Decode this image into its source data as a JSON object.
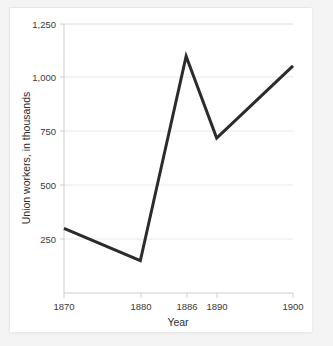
{
  "chart_data": {
    "type": "line",
    "title": "",
    "xlabel": "Year",
    "ylabel": "Union workers, in thousands",
    "x": [
      1870,
      1880,
      1886,
      1890,
      1900
    ],
    "values": [
      300,
      150,
      1100,
      720,
      1055
    ],
    "series": [
      {
        "name": "Union workers",
        "values": [
          300,
          150,
          1100,
          720,
          1055
        ]
      }
    ],
    "xtick_labels": [
      "1870",
      "1880",
      "1886",
      "1890",
      "1900"
    ],
    "xtick_values": [
      1870,
      1880,
      1886,
      1890,
      1900
    ],
    "ytick_labels": [
      "250",
      "500",
      "750",
      "1,000",
      "1,250"
    ],
    "ytick_values": [
      250,
      500,
      750,
      1000,
      1250
    ],
    "xlim": [
      1870,
      1900
    ],
    "ylim": [
      0,
      1250
    ],
    "grid": "horizontal",
    "legend": "none",
    "line_color": "#2b2b2b",
    "grid_color": "#e3e3e3",
    "axis_color": "#cccccc",
    "background_color": "#ffffff"
  },
  "labels": {
    "x_axis_title": "Year",
    "y_axis_title": "Union workers, in thousands",
    "y_1250": "1,250",
    "y_1000": "1,000",
    "y_750": "750",
    "y_500": "500",
    "y_250": "250",
    "x_1870": "1870",
    "x_1880": "1880",
    "x_1886": "1886",
    "x_1890": "1890",
    "x_1900": "1900"
  }
}
